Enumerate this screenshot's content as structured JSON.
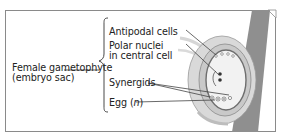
{
  "diagram": {
    "main_label": {
      "line1": "Female gametophyte",
      "line2": "(embryo sac)"
    },
    "parts": [
      {
        "label": "Antipodal cells"
      },
      {
        "label_line1": "Polar nuclei",
        "label_line2": "in central cell"
      },
      {
        "label": "Synergids"
      },
      {
        "label_prefix": "Egg (",
        "label_italic": "n",
        "label_suffix": ")"
      }
    ],
    "colors": {
      "stalk": "#8f8f8f",
      "integument": "#d9d9d9",
      "embryo_sac": "#f0f0f0",
      "outline": "#6e6e6e",
      "border": "#8a8a8a",
      "text": "#222222"
    }
  }
}
